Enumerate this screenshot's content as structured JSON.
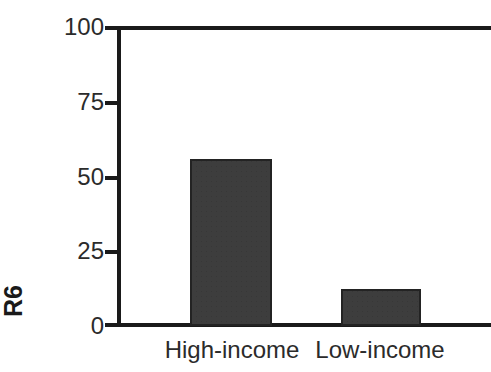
{
  "chart_data": {
    "type": "bar",
    "title": "",
    "subtitle": "",
    "xlabel": "",
    "ylabel": "R6",
    "categories": [
      "High-income",
      "Low-income"
    ],
    "values": [
      56,
      12.5
    ],
    "ylim": [
      0,
      100
    ],
    "yticks": [
      0,
      25,
      50,
      75,
      100
    ],
    "ytick_labels": [
      "0",
      "25",
      "50",
      "75",
      "100"
    ],
    "grid": false,
    "legend": null,
    "legend_position": "none",
    "bar_color": "#3d3d3d",
    "bar_edge_color": "#232323",
    "axis_color": "#1a1a1a",
    "background": "#ffffff",
    "annotations": []
  }
}
